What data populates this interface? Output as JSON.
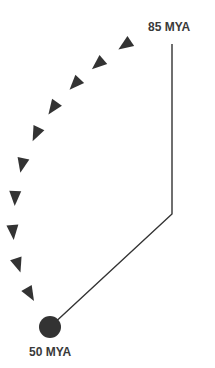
{
  "labels": {
    "start": "85 MYA",
    "end": "50 MYA"
  },
  "colors": {
    "marker": "#333333",
    "line": "#333333",
    "text": "#3a3a3a",
    "background": "#ffffff"
  },
  "path": {
    "vertical_top": [
      172,
      44
    ],
    "corner": [
      172,
      214
    ],
    "end_dot": [
      50,
      327
    ],
    "dot_radius": 11
  },
  "arrows": [
    {
      "x": 125,
      "y": 45,
      "angle": 146
    },
    {
      "x": 98,
      "y": 64,
      "angle": 140
    },
    {
      "x": 75,
      "y": 84,
      "angle": 133
    },
    {
      "x": 53,
      "y": 108,
      "angle": 125
    },
    {
      "x": 36,
      "y": 134,
      "angle": 115
    },
    {
      "x": 22,
      "y": 165,
      "angle": 102
    },
    {
      "x": 15,
      "y": 198,
      "angle": 92
    },
    {
      "x": 13,
      "y": 232,
      "angle": 85
    },
    {
      "x": 18,
      "y": 265,
      "angle": 72
    },
    {
      "x": 30,
      "y": 294,
      "angle": 60
    }
  ]
}
